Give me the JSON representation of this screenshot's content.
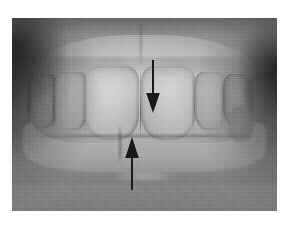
{
  "page": {
    "type": "clinical-photograph",
    "background_color": "#ffffff",
    "width": 291,
    "height": 229
  },
  "photo": {
    "name": "intraoral-frontal-photograph",
    "modality": "grayscale-clinical-photo",
    "subject": "anterior-teeth-in-occlusion",
    "frame": {
      "x": 12,
      "y": 18,
      "width": 265,
      "height": 193
    },
    "tone": {
      "background": "#7d7d7d",
      "mucosa_mid": "#8d8d8d",
      "enamel_light": "#d6d6d6",
      "shadow_dark": "#303030"
    },
    "regions": [
      {
        "name": "upper-gingiva",
        "label": "Maxillary gingiva"
      },
      {
        "name": "upper-arch",
        "label": "Maxillary anterior teeth"
      },
      {
        "name": "upper-central-incisor-left",
        "label": "Upper left central incisor"
      },
      {
        "name": "upper-central-incisor-right",
        "label": "Upper right central incisor"
      },
      {
        "name": "upper-lateral-incisor-left",
        "label": "Upper left lateral incisor"
      },
      {
        "name": "upper-lateral-incisor-right",
        "label": "Upper right lateral incisor"
      },
      {
        "name": "upper-canine-left",
        "label": "Upper left canine"
      },
      {
        "name": "upper-canine-right",
        "label": "Upper right canine"
      },
      {
        "name": "lower-arch",
        "label": "Mandibular anterior teeth"
      },
      {
        "name": "lower-lip",
        "label": "Lower lip and tongue contour"
      },
      {
        "name": "buccal-corridor-left",
        "label": "Left buccal corridor shadow"
      },
      {
        "name": "buccal-corridor-right",
        "label": "Right buccal corridor shadow"
      }
    ]
  },
  "annotations": {
    "count": 2,
    "color": "#141414",
    "items": [
      {
        "name": "arrow-upper",
        "direction": "down",
        "points_at": "maxillary-dental-midline",
        "position": {
          "x": 141,
          "y": 62,
          "tip_y": 95
        },
        "description": "Downward arrow indicating the upper dental midline"
      },
      {
        "name": "arrow-lower",
        "direction": "up",
        "points_at": "mandibular-dental-midline",
        "position": {
          "x": 120,
          "y": 168,
          "tip_y": 128
        },
        "description": "Upward arrow indicating the lower dental midline"
      }
    ]
  }
}
